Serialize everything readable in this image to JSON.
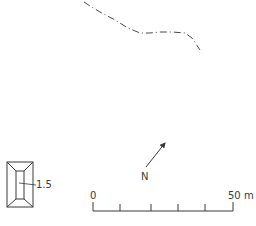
{
  "map": {
    "boundary_line": {
      "style": "dash-dot",
      "color": "#4a4a4a",
      "points": [
        [
          84,
          2
        ],
        [
          90,
          6
        ],
        [
          100,
          12
        ],
        [
          115,
          20
        ],
        [
          128,
          28
        ],
        [
          140,
          33
        ],
        [
          150,
          33
        ],
        [
          160,
          32
        ],
        [
          172,
          32
        ],
        [
          185,
          33
        ],
        [
          192,
          38
        ],
        [
          196,
          44
        ],
        [
          200,
          50
        ]
      ]
    },
    "structure": {
      "label": "1.5",
      "outer": {
        "x": 7,
        "y": 162,
        "w": 26,
        "h": 45
      },
      "inner": {
        "x": 16,
        "y": 171,
        "w": 8,
        "h": 28
      }
    },
    "north_arrow": {
      "label": "N",
      "from": [
        146,
        167
      ],
      "to": [
        165,
        143
      ]
    },
    "scale_bar": {
      "start_label": "0",
      "end_label": "50 m",
      "x_start": 93,
      "x_end": 233,
      "y": 211,
      "ticks": [
        93,
        120,
        151,
        178,
        205,
        233
      ]
    },
    "colors": {
      "ink": "#3a3a3a",
      "background": "#ffffff"
    }
  }
}
